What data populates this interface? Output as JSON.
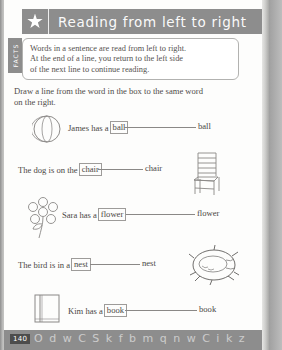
{
  "header": {
    "icon": "star-icon",
    "title": "Reading from left to right"
  },
  "side_tab": {
    "label": "FACTS"
  },
  "fact_box": {
    "lines": [
      "Words in a sentence are read from left to right.",
      "At the end of a line, you return to the left side",
      "of the next line to continue reading."
    ]
  },
  "instruction": {
    "lines": [
      "Draw a line from the word in the box to the same word",
      "on the right."
    ]
  },
  "exercises": [
    {
      "sentence_before": "James has a",
      "boxed_word": "ball",
      "sentence_after": "",
      "target_word": "ball",
      "art": "ball-illustration",
      "art_side": "left"
    },
    {
      "sentence_before": "The dog is on the",
      "boxed_word": "chair",
      "sentence_after": "",
      "target_word": "chair",
      "art": "chair-illustration",
      "art_side": "right"
    },
    {
      "sentence_before": "Sara has a",
      "boxed_word": "flower",
      "sentence_after": "",
      "target_word": "flower",
      "art": "flower-illustration",
      "art_side": "left"
    },
    {
      "sentence_before": "The bird is in a",
      "boxed_word": "nest",
      "sentence_after": "",
      "target_word": "nest",
      "art": "nest-illustration",
      "art_side": "right"
    },
    {
      "sentence_before": "Kim has a",
      "boxed_word": "book",
      "sentence_after": "",
      "target_word": "book",
      "art": "book-illustration",
      "art_side": "left"
    }
  ],
  "footer": {
    "page_number": "140",
    "decoration": "O d w C S k f b m q n w C  i k  z"
  },
  "colors": {
    "header_gray": "#8d8d8d",
    "page_white": "#fdfdfc",
    "ink": "#4a4744",
    "scan_background": "#9e9e9e"
  }
}
